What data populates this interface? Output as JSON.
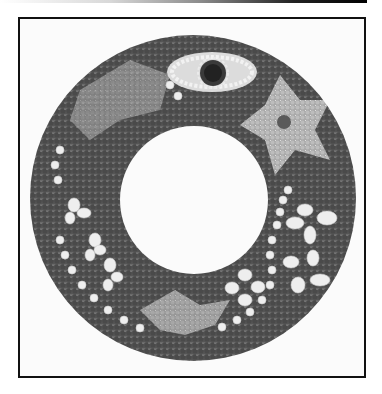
{
  "image": {
    "subject": "circular bead/seed mosaic wreath",
    "tone": "grayscale photograph",
    "motifs": [
      "eye-shaped ornament",
      "light-gray star shape",
      "white flowers",
      "light-gray bird",
      "white bead vines"
    ],
    "colors": {
      "background": "#fbfbfb",
      "frame": "#111111",
      "dark_beads": "#4a4a4a",
      "mid_beads": "#8e8e8e",
      "light_beads": "#bdbdbd",
      "white_beads": "#eeeeee"
    }
  }
}
